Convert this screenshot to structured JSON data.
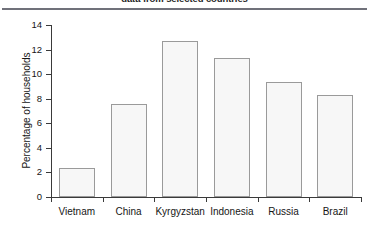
{
  "chart_data": {
    "type": "bar",
    "title": "data from selected countries",
    "categories": [
      "Vietnam",
      "China",
      "Kyrgyzstan",
      "Indonesia",
      "Russia",
      "Brazil"
    ],
    "values": [
      2.4,
      7.6,
      12.7,
      11.3,
      9.4,
      8.3
    ],
    "xlabel": "",
    "ylabel": "Percentage of households",
    "ylim": [
      0,
      14
    ],
    "yticks": [
      0,
      2,
      4,
      6,
      8,
      10,
      12,
      14
    ],
    "ytick_labels": [
      "0",
      "2",
      "4",
      "6",
      "8",
      "10",
      "12",
      "14"
    ],
    "grid": false,
    "legend": null,
    "bar_fill_color": "#f7f7f7",
    "bar_border_color": "#9a9a9a",
    "axis_color": "#3a3a3a",
    "rule_color": "#70717a"
  }
}
